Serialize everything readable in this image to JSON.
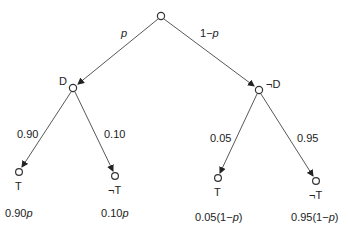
{
  "diagram": {
    "type": "probability-tree",
    "root": {
      "label": ""
    },
    "level1": [
      {
        "id": "D",
        "label": "D",
        "edge_label": "p"
      },
      {
        "id": "notD",
        "label": "¬D",
        "edge_label": "1−p"
      }
    ],
    "level2": [
      {
        "parent": "D",
        "label": "T",
        "edge_label": "0.90",
        "joint": "0.90p"
      },
      {
        "parent": "D",
        "label": "¬T",
        "edge_label": "0.10",
        "joint": "0.10p"
      },
      {
        "parent": "notD",
        "label": "T",
        "edge_label": "0.05",
        "joint": "0.05(1−p)"
      },
      {
        "parent": "notD",
        "label": "¬T",
        "edge_label": "0.95",
        "joint": "0.95(1−p)"
      }
    ]
  },
  "colors": {
    "line": "#444444",
    "node_stroke": "#333333",
    "text": "#222222",
    "background": "#ffffff"
  }
}
